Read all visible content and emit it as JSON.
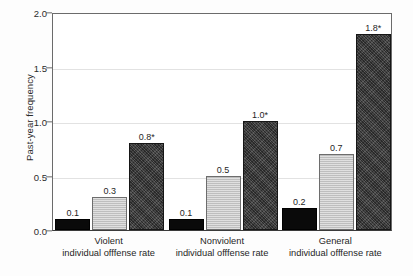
{
  "chart_data": {
    "type": "bar",
    "title": "",
    "subtitle": "",
    "xlabel": "",
    "ylabel": "Past-year frequency",
    "ylim": [
      0,
      2.0
    ],
    "yticks": [
      "0.0",
      "0.5",
      "1.0",
      "1.5",
      "2.0"
    ],
    "ytick_values": [
      0.0,
      0.5,
      1.0,
      1.5,
      2.0
    ],
    "grid": "horizontal",
    "legend": "none",
    "categories": [
      "Violent individual offfense rate",
      "Nonviolent individual offfense rate",
      "General individual offfense rate"
    ],
    "category_lines": [
      {
        "line1": "Violent",
        "line2": "individual offfense rate"
      },
      {
        "line1": "Nonviolent",
        "line2": "individual offfense rate"
      },
      {
        "line1": "General",
        "line2": "individual offfense rate"
      }
    ],
    "series": [
      {
        "name": "series-1",
        "style": "black",
        "color": "#0a0a0a",
        "values": [
          0.1,
          0.1,
          0.2
        ],
        "labels": [
          "0.1",
          "0.1",
          "0.2"
        ]
      },
      {
        "name": "series-2",
        "style": "light-gray",
        "color": "#c6c6c6",
        "values": [
          0.3,
          0.5,
          0.7
        ],
        "labels": [
          "0.3",
          "0.5",
          "0.7"
        ]
      },
      {
        "name": "series-3",
        "style": "dark-textured",
        "color": "#3f3f3f",
        "values": [
          0.8,
          1.0,
          1.8
        ],
        "labels": [
          "0.8*",
          "1.0*",
          "1.8*"
        ]
      }
    ],
    "annotations": {
      "significance_marker": "*"
    }
  }
}
